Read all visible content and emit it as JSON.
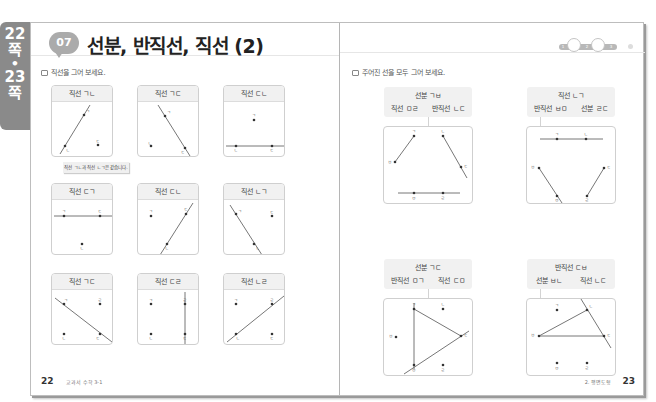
{
  "side_tab": {
    "page_from": "22",
    "page_from_unit": "쪽",
    "separator": "•",
    "page_to": "23",
    "page_to_unit": "쪽"
  },
  "left_page": {
    "lesson_number": "07",
    "lesson_suffix": "회",
    "title": "선분, 반직선, 직선 (2)",
    "instruction": "직선을 그어 보세요.",
    "note": "직선 ㄱㄴ과 직선 ㄴㄱ은 같습니다.",
    "cards": [
      {
        "label": "직선 ㄱㄴ"
      },
      {
        "label": "직선 ㄱㄷ"
      },
      {
        "label": "직선 ㄷㄴ"
      },
      {
        "label": "직선 ㄷㄱ"
      },
      {
        "label": "직선 ㄷㄴ"
      },
      {
        "label": "직선 ㄴㄱ"
      },
      {
        "label": "직선 ㄱㄷ"
      },
      {
        "label": "직선 ㄷㄹ"
      },
      {
        "label": "직선 ㄴㄹ"
      }
    ],
    "page_number": "22",
    "footer": "교과서 수학 3-1"
  },
  "right_page": {
    "progress": {
      "steps": [
        "1",
        "2",
        "3"
      ]
    },
    "instruction": "주어진 선을 모두 그어 보세요.",
    "problems": [
      {
        "top": "선분 ㄱㅂ",
        "left": "직선 ㅁㄹ",
        "right": "반직선 ㄴㄷ"
      },
      {
        "top": "직선 ㄴㄱ",
        "left": "반직선 ㅂㅁ",
        "right": "선분 ㄹㄷ"
      },
      {
        "top": "선분 ㄱㄷ",
        "left": "반직선 ㅁㄱ",
        "right": "직선 ㄷㅁ"
      },
      {
        "top": "반직선 ㄷㅂ",
        "left": "선분 ㅂㄴ",
        "right": "직선 ㄴㄷ"
      }
    ],
    "page_number": "23",
    "footer": "2. 평면도형"
  }
}
